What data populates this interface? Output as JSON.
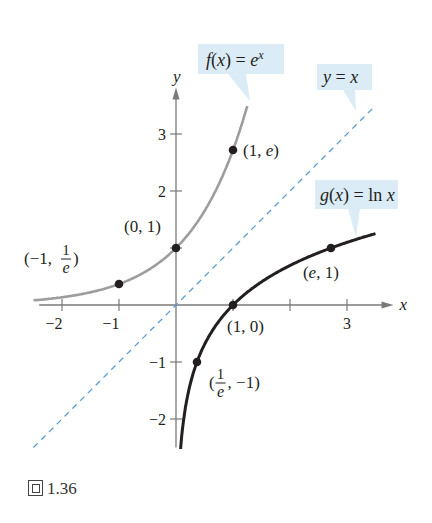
{
  "chart_data": {
    "type": "line",
    "title": "",
    "xlabel": "x",
    "ylabel": "y",
    "xlim": [
      -2.5,
      3.5
    ],
    "ylim": [
      -2.5,
      3.5
    ],
    "grid": false,
    "x_ticks": [
      {
        "value": -2,
        "label": "−2"
      },
      {
        "value": -1,
        "label": "−1"
      },
      {
        "value": 1,
        "label": ""
      },
      {
        "value": 2,
        "label": ""
      },
      {
        "value": 3,
        "label": "3"
      }
    ],
    "y_ticks": [
      {
        "value": -2,
        "label": "−2"
      },
      {
        "value": -1,
        "label": "−1"
      },
      {
        "value": 1,
        "label": ""
      },
      {
        "value": 2,
        "label": "2"
      },
      {
        "value": 3,
        "label": "3"
      }
    ],
    "series": [
      {
        "name": "f(x) = e^x",
        "function": "exp",
        "x_range": [
          -2.5,
          1.25
        ],
        "color": "#9d9d9d",
        "style": "solid"
      },
      {
        "name": "g(x) = ln x",
        "function": "ln",
        "x_range": [
          0.08,
          3.5
        ],
        "color": "#231f20",
        "style": "solid"
      },
      {
        "name": "y = x",
        "function": "identity",
        "x_range": [
          -2.5,
          3.5
        ],
        "color": "#5b9bd5",
        "style": "dashed"
      }
    ],
    "points": [
      {
        "x": -1,
        "y": 0.3679,
        "label_parts": [
          "(−1, ",
          "1",
          "e",
          ")"
        ],
        "fraction": true
      },
      {
        "x": 0,
        "y": 1,
        "label": "(0, 1)"
      },
      {
        "x": 1,
        "y": 2.7183,
        "label": "(1, e)"
      },
      {
        "x": 1,
        "y": 0,
        "label": "(1, 0)"
      },
      {
        "x": 2.7183,
        "y": 1,
        "label": "(e, 1)"
      },
      {
        "x": 0.3679,
        "y": -1,
        "label_parts": [
          "(",
          "1",
          "e",
          ", −1)"
        ],
        "fraction": true
      }
    ],
    "callouts": [
      {
        "text": "f(x) = e^x",
        "target_series": "f(x) = e^x"
      },
      {
        "text": "y = x",
        "target_series": "y = x"
      },
      {
        "text": "g(x) = ln x",
        "target_series": "g(x) = ln x"
      }
    ],
    "colors": {
      "axis": "#7a7a7a",
      "callout_bg": "#dcecf7",
      "text": "#231f20"
    }
  },
  "caption": {
    "prefix": "圖",
    "number": "1.36"
  }
}
